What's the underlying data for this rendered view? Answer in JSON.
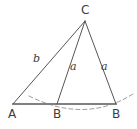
{
  "figure": {
    "kind": "geometry-diagram",
    "background_color": "#ffffff",
    "stroke_color": "#555555",
    "baseline_color": "#808080",
    "dash_color": "#9a9a9a",
    "text_color": "#3c3c3c",
    "points": {
      "C": {
        "label": "C",
        "x": 85,
        "y": 21
      },
      "A": {
        "label": "A",
        "x": 13,
        "y": 104
      },
      "B1": {
        "label": "B",
        "x": 57,
        "y": 104
      },
      "B2": {
        "label": "B",
        "x": 116,
        "y": 104
      }
    },
    "segments": [
      {
        "name": "side-b",
        "from": "A",
        "to": "C",
        "label": "b"
      },
      {
        "name": "side-a1",
        "from": "B1",
        "to": "C",
        "label": "a"
      },
      {
        "name": "side-a2",
        "from": "B2",
        "to": "C",
        "label": "a"
      },
      {
        "name": "baseline-a-to-b1",
        "from": "A",
        "to": "B1",
        "label": ""
      },
      {
        "name": "baseline-b1-to-b2",
        "from": "B1",
        "to": "B2",
        "label": ""
      }
    ],
    "side_labels": {
      "b": "b",
      "a_left": "a",
      "a_right": "a"
    },
    "vertex_labels": {
      "apex": "C",
      "left": "A",
      "middle": "B",
      "right": "B"
    },
    "arc": {
      "name": "construction-arc",
      "style": "dashed",
      "center_x": 85,
      "center_y": 21,
      "radius": 88
    }
  }
}
